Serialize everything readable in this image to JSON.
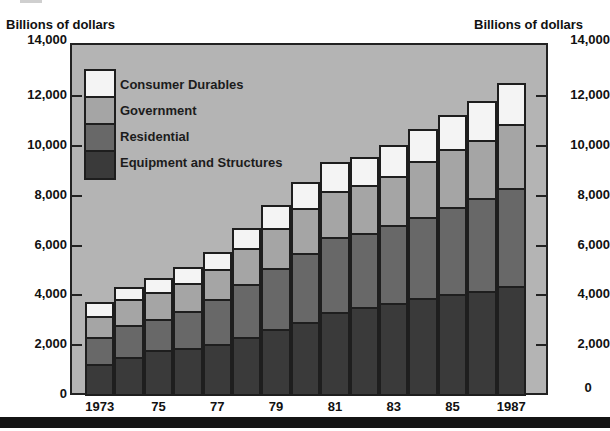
{
  "chart_data": {
    "type": "bar",
    "stacked": true,
    "title": "",
    "xlabel": "",
    "ylabel": "Billions of dollars",
    "ylabel_right": "Billions of dollars",
    "ylim": [
      0,
      14000
    ],
    "yticks": [
      0,
      2000,
      4000,
      6000,
      8000,
      10000,
      12000,
      14000
    ],
    "ytick_labels": [
      "0",
      "2,000",
      "4,000",
      "6,000",
      "8,000",
      "10,000",
      "12,000",
      "14,000"
    ],
    "categories": [
      "1973",
      "1974",
      "1975",
      "1976",
      "1977",
      "1978",
      "1979",
      "1980",
      "1981",
      "1982",
      "1983",
      "1984",
      "1985",
      "1986",
      "1987"
    ],
    "xtick_labels": [
      "1973",
      "75",
      "77",
      "79",
      "81",
      "83",
      "85",
      "1987"
    ],
    "xtick_positions": [
      "1973",
      "1975",
      "1977",
      "1979",
      "1981",
      "1983",
      "1985",
      "1987"
    ],
    "series": [
      {
        "name": "Equipment and Structures",
        "color": "#3a3a3a",
        "values": [
          1200,
          1500,
          1750,
          1850,
          2000,
          2300,
          2600,
          2900,
          3300,
          3500,
          3650,
          3850,
          4000,
          4150,
          4350
        ]
      },
      {
        "name": "Residential",
        "color": "#686868",
        "values": [
          1100,
          1250,
          1250,
          1500,
          1800,
          2100,
          2450,
          2750,
          3000,
          2950,
          3150,
          3250,
          3500,
          3700,
          3900
        ]
      },
      {
        "name": "Government",
        "color": "#a5a5a5",
        "values": [
          850,
          1050,
          1100,
          1100,
          1200,
          1450,
          1600,
          1800,
          1850,
          1950,
          1950,
          2250,
          2350,
          2350,
          2600
        ]
      },
      {
        "name": "Consumer Durables",
        "color": "#f4f4f4",
        "values": [
          550,
          500,
          550,
          650,
          700,
          800,
          950,
          1050,
          1150,
          1100,
          1250,
          1300,
          1350,
          1550,
          1650
        ]
      }
    ],
    "legend": {
      "position": "upper-left-inside",
      "entries": [
        "Consumer Durables",
        "Government",
        "Residential",
        "Equipment and Structures"
      ]
    },
    "grid": false,
    "background_color": "#b4b4b4"
  },
  "labels": {
    "left_axis_title": "Billions of dollars",
    "right_axis_title": "Billions of dollars"
  }
}
